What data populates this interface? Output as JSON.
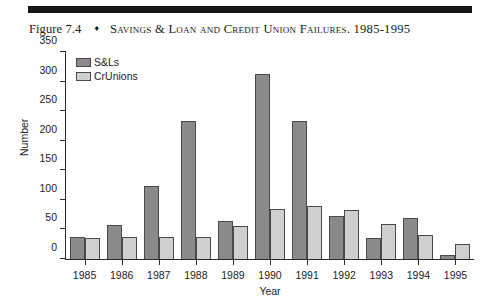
{
  "caption": {
    "figure_number": "Figure 7.4",
    "diamond_glyph": "♦",
    "title": "Savings & Loan and Credit Union Failures. 1985-1995"
  },
  "colors": {
    "sl_fill": "#8a8a8a",
    "cr_fill": "#cfcfcf",
    "bar_stroke": "#4a4a4a",
    "axis": "#2b2b2b",
    "rule": "#171717",
    "background": "#ffffff"
  },
  "legend": {
    "position": "inside-top-left",
    "entries": [
      {
        "label": "S&Ls",
        "color": "#8a8a8a"
      },
      {
        "label": "CrUnions",
        "color": "#cfcfcf"
      }
    ]
  },
  "chart_data": {
    "type": "bar",
    "title": "Savings & Loan and Credit Union Failures. 1985-1995",
    "xlabel": "Year",
    "ylabel": "Number",
    "categories": [
      "1985",
      "1986",
      "1987",
      "1988",
      "1989",
      "1990",
      "1991",
      "1992",
      "1993",
      "1994",
      "1995"
    ],
    "series": [
      {
        "name": "S&Ls",
        "values": [
          38,
          58,
          124,
          233,
          64,
          313,
          233,
          73,
          36,
          70,
          7
        ]
      },
      {
        "name": "CrUnions",
        "values": [
          35,
          38,
          38,
          38,
          56,
          85,
          89,
          83,
          59,
          40,
          25
        ]
      }
    ],
    "ylim": [
      0,
      350
    ],
    "yticks": [
      0,
      50,
      100,
      150,
      200,
      250,
      300,
      350
    ],
    "ytick_labels": [
      "0",
      "50",
      "100",
      "150",
      "200",
      "250",
      "300",
      "350"
    ],
    "grid": false,
    "legend_position": "upper left"
  }
}
